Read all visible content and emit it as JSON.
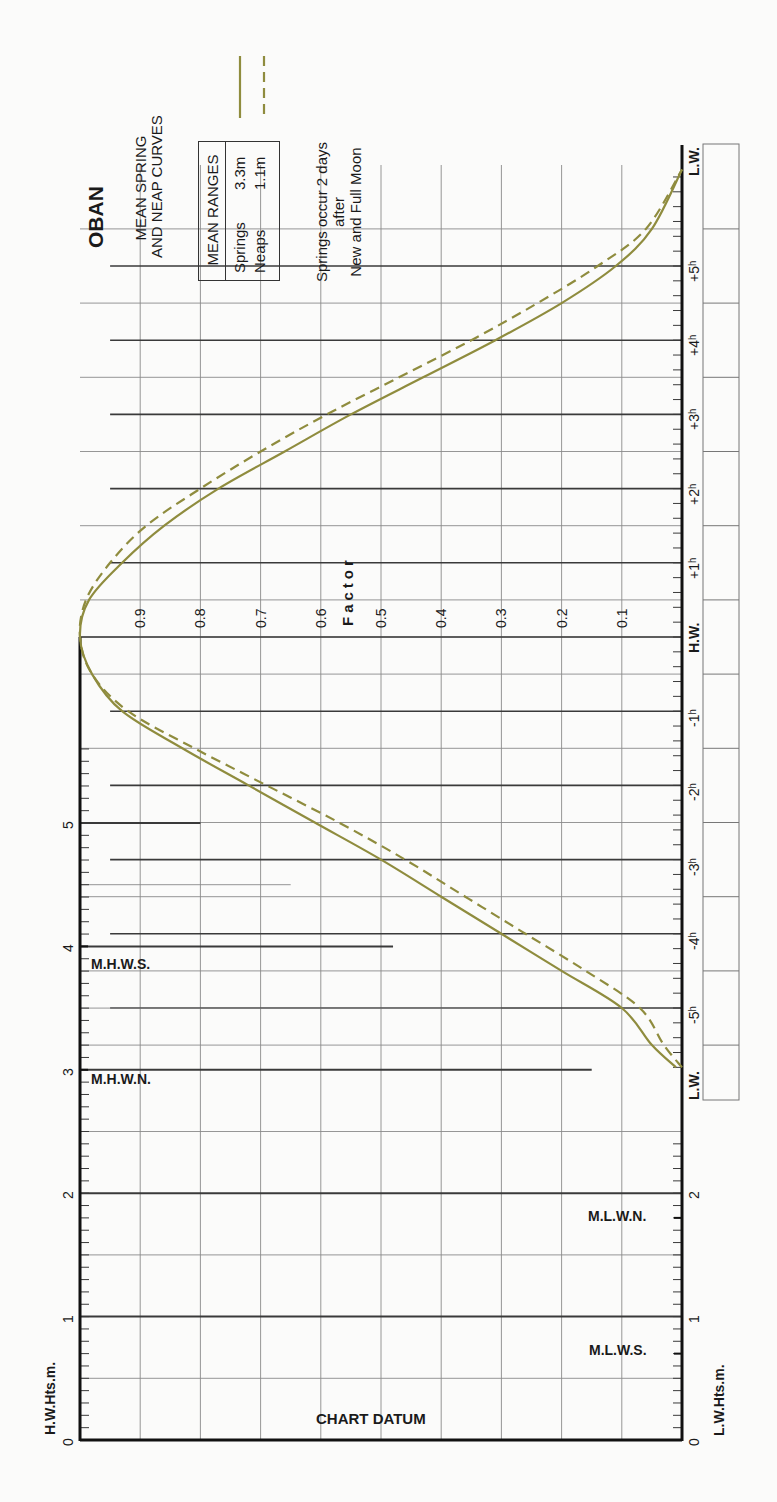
{
  "title": "OBAN",
  "subtitle_lines": [
    "MEAN SPRING",
    "AND NEAP CURVES"
  ],
  "mean_ranges": {
    "header": "MEAN RANGES",
    "rows": [
      {
        "label": "Springs",
        "value": "3.3m"
      },
      {
        "label": "Neaps",
        "value": "1.1m"
      }
    ]
  },
  "note_lines": [
    "Springs occur 2 days",
    "after",
    "New and Full Moon"
  ],
  "legend": [
    {
      "name": "Springs",
      "style": "solid"
    },
    {
      "name": "Neaps",
      "style": "dashed"
    }
  ],
  "colors": {
    "curve": "#8f8c3e",
    "grid_heavy": "#3a3a3a",
    "grid_light": "#8a8a8a",
    "axis": "#111111"
  },
  "factor_label": "Factor",
  "hw_axis_label": "H.W.Hts.m.",
  "lw_axis_label": "L.W.Hts.m.",
  "chart_datum_label": "CHART DATUM",
  "hw_levels": [
    {
      "label": "M.H.W.S.",
      "value": 4.0
    },
    {
      "label": "M.H.W.N.",
      "value": 3.0
    }
  ],
  "lw_levels": [
    {
      "label": "M.L.W.N.",
      "value": 1.8
    },
    {
      "label": "M.L.W.S.",
      "value": 0.7
    }
  ],
  "chart_data": {
    "type": "line",
    "xlabel": "Time relative to H.W. (hours)",
    "ylabel": "Factor",
    "time_tick_labels": [
      "L.W.",
      "-5h",
      "-4h",
      "-3h",
      "-2h",
      "-1h",
      "H.W.",
      "+1h",
      "+2h",
      "+3h",
      "+4h",
      "+5h",
      "L.W."
    ],
    "factor_tick_labels": [
      "0.9",
      "0.8",
      "0.7",
      "0.6",
      "0.5",
      "0.4",
      "0.3",
      "0.2",
      "0.1"
    ],
    "hw_height_ticks": [
      "0",
      "1",
      "2",
      "3",
      "4",
      "5"
    ],
    "lw_height_ticks": [
      "0",
      "1",
      "2"
    ],
    "ylim": [
      0,
      1
    ],
    "xlim": [
      -5.8,
      6.3
    ],
    "grid": true,
    "series": [
      {
        "name": "Springs",
        "style": "solid",
        "x": [
          -5.8,
          -5.5,
          -5.0,
          -4.5,
          -4.0,
          -3.5,
          -3.0,
          -2.5,
          -2.0,
          -1.5,
          -1.0,
          -0.5,
          0.0,
          0.5,
          1.0,
          1.5,
          2.0,
          2.5,
          3.0,
          3.5,
          4.0,
          4.5,
          5.0,
          5.5,
          6.3
        ],
        "values": [
          0.01,
          0.05,
          0.1,
          0.2,
          0.3,
          0.4,
          0.5,
          0.61,
          0.72,
          0.83,
          0.93,
          0.98,
          1.0,
          0.985,
          0.93,
          0.86,
          0.77,
          0.66,
          0.55,
          0.43,
          0.31,
          0.2,
          0.11,
          0.05,
          0.0
        ]
      },
      {
        "name": "Neaps",
        "style": "dashed",
        "x": [
          -5.8,
          -5.5,
          -5.0,
          -4.5,
          -4.0,
          -3.5,
          -3.0,
          -2.5,
          -2.0,
          -1.5,
          -1.0,
          -0.5,
          0.0,
          0.5,
          1.0,
          1.5,
          2.0,
          2.5,
          3.0,
          3.5,
          4.0,
          4.5,
          5.0,
          5.5,
          6.3
        ],
        "values": [
          0.0,
          0.03,
          0.07,
          0.16,
          0.26,
          0.36,
          0.46,
          0.57,
          0.69,
          0.81,
          0.92,
          0.98,
          1.0,
          0.99,
          0.95,
          0.89,
          0.8,
          0.7,
          0.59,
          0.47,
          0.35,
          0.24,
          0.14,
          0.06,
          0.0
        ]
      }
    ]
  }
}
